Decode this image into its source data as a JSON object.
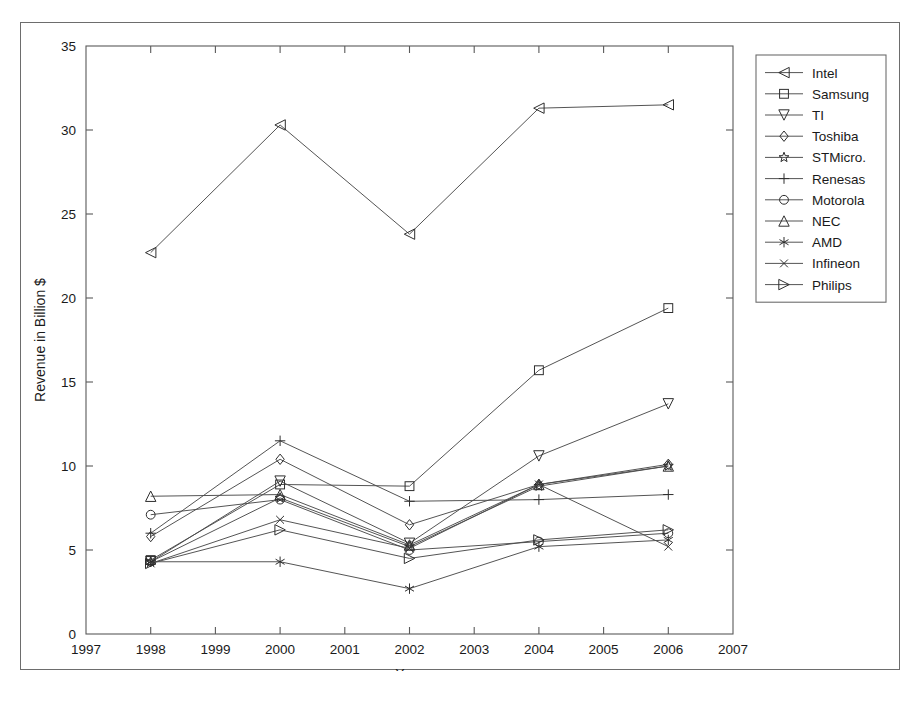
{
  "figure": {
    "border_color": "#6d6d6d",
    "background": "#ffffff"
  },
  "chart_data": {
    "type": "line",
    "title": "",
    "xlabel": "Year",
    "ylabel": "Revenue in Billion $",
    "xlim": [
      1997,
      2007
    ],
    "ylim": [
      0,
      35
    ],
    "xticks": [
      1997,
      1998,
      1999,
      2000,
      2001,
      2002,
      2003,
      2004,
      2005,
      2006,
      2007
    ],
    "xticklabels": [
      "1997",
      "1998",
      "1999",
      "2000",
      "2001",
      "2002",
      "2003",
      "2004",
      "2005",
      "2006",
      "2007"
    ],
    "yticks": [
      0,
      5,
      10,
      15,
      20,
      25,
      30,
      35
    ],
    "yticklabels": [
      "0",
      "5",
      "10",
      "15",
      "20",
      "25",
      "30",
      "35"
    ],
    "grid": false,
    "legend_position": "outside-right-top",
    "x": [
      1998,
      2000,
      2002,
      2004,
      2006
    ],
    "series": [
      {
        "name": "Intel",
        "marker": "left-triangle",
        "values": [
          22.7,
          30.3,
          23.8,
          31.3,
          31.5
        ]
      },
      {
        "name": "Samsung",
        "marker": "square",
        "values": [
          4.4,
          8.9,
          8.8,
          15.7,
          19.4
        ]
      },
      {
        "name": "TI",
        "marker": "down-triangle",
        "values": [
          4.3,
          9.1,
          5.4,
          10.6,
          13.7
        ]
      },
      {
        "name": "Toshiba",
        "marker": "diamond",
        "values": [
          5.8,
          10.4,
          6.5,
          8.9,
          10.1
        ]
      },
      {
        "name": "STMicro.",
        "marker": "pentagram",
        "values": [
          4.3,
          8.1,
          5.2,
          8.8,
          10.0
        ]
      },
      {
        "name": "Renesas",
        "marker": "plus",
        "values": [
          6.0,
          11.5,
          7.9,
          8.0,
          8.3
        ]
      },
      {
        "name": "Motorola",
        "marker": "circle",
        "values": [
          7.1,
          8.0,
          5.0,
          5.5,
          6.0
        ]
      },
      {
        "name": "NEC",
        "marker": "up-triangle",
        "values": [
          8.2,
          8.3,
          5.3,
          8.9,
          10.0
        ]
      },
      {
        "name": "AMD",
        "marker": "asterisk",
        "values": [
          4.3,
          4.3,
          2.7,
          5.2,
          5.6
        ]
      },
      {
        "name": "Infineon",
        "marker": "x-cross",
        "values": [
          4.2,
          6.8,
          5.1,
          8.9,
          5.2
        ]
      },
      {
        "name": "Philips",
        "marker": "right-triangle",
        "values": [
          4.2,
          6.2,
          4.5,
          5.6,
          6.2
        ]
      }
    ]
  },
  "legend": {
    "entries": [
      "Intel",
      "Samsung",
      "TI",
      "Toshiba",
      "STMicro.",
      "Renesas",
      "Motorola",
      "NEC",
      "AMD",
      "Infineon",
      "Philips"
    ]
  }
}
